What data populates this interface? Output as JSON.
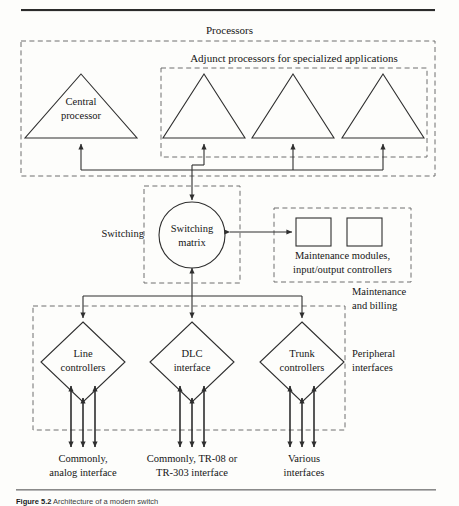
{
  "figure": {
    "caption_bold": "Figure 5.2",
    "caption_rest": "Architecture of a modern switch"
  },
  "groups": {
    "processors": "Processors",
    "adjunct": "Adjunct processors for specialized applications",
    "switching": "Switching",
    "maintenance_billing_line1": "Maintenance",
    "maintenance_billing_line2": "and billing",
    "peripheral_line1": "Peripheral",
    "peripheral_line2": "interfaces"
  },
  "nodes": {
    "central_processor_line1": "Central",
    "central_processor_line2": "processor",
    "adjunct_1": "",
    "adjunct_2": "",
    "adjunct_3": "",
    "switching_matrix_line1": "Switching",
    "switching_matrix_line2": "matrix",
    "maintenance_modules_line1": "Maintenance modules,",
    "maintenance_modules_line2": "input/output controllers",
    "line_controllers_line1": "Line",
    "line_controllers_line2": "controllers",
    "dlc_interface_line1": "DLC",
    "dlc_interface_line2": "interface",
    "trunk_controllers_line1": "Trunk",
    "trunk_controllers_line2": "controllers"
  },
  "interfaces": {
    "line_line1": "Commonly,",
    "line_line2": "analog interface",
    "dlc_line1": "Commonly, TR-08 or",
    "dlc_line2": "TR-303 interface",
    "trunk_line1": "Various",
    "trunk_line2": "interfaces"
  },
  "colors": {
    "stroke": "#2f2f2f",
    "dashed": "#6f6f6f",
    "text": "#151515",
    "rule": "#2b2b2b",
    "background": "#fdfdfb"
  }
}
